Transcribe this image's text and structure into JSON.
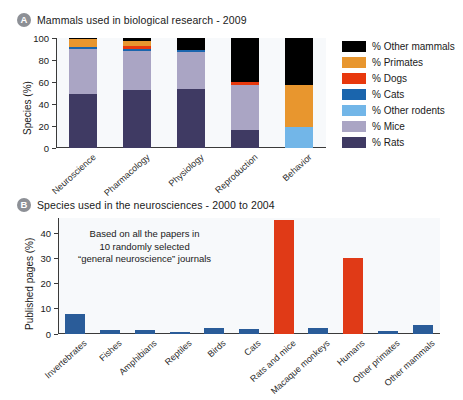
{
  "panel_a": {
    "badge": "A",
    "title": "Mammals used in biological research - 2009",
    "ylabel": "Species (%)",
    "categories": [
      "Neuroscience",
      "Pharmacology",
      "Physiology",
      "Reproduction",
      "Behavior"
    ],
    "yticks": [
      "0",
      "20",
      "40",
      "60",
      "80",
      "100"
    ]
  },
  "panel_b": {
    "badge": "B",
    "title": "Species used in the neurosciences - 2000 to 2004",
    "ylabel": "Published pages (%)",
    "yticks": [
      "0",
      "10",
      "20",
      "30",
      "40"
    ],
    "annotation_lines": [
      "Based on all the papers in",
      "10 randomly selected",
      "“general neuroscience” journals"
    ]
  },
  "legend": {
    "items": [
      {
        "label": "% Other mammals",
        "color": "#000000"
      },
      {
        "label": "% Primates",
        "color": "#e8962e"
      },
      {
        "label": "% Dogs",
        "color": "#e8380d"
      },
      {
        "label": "% Cats",
        "color": "#1a65ad"
      },
      {
        "label": "% Other rodents",
        "color": "#72b6e8"
      },
      {
        "label": "% Mice",
        "color": "#aaa5c4"
      },
      {
        "label": "% Rats",
        "color": "#3f3a63"
      }
    ]
  },
  "chart_data": [
    {
      "id": "panel-a",
      "type": "bar",
      "stacked": true,
      "title": "Mammals used in biological research - 2009",
      "xlabel": "",
      "ylabel": "Species (%)",
      "ylim": [
        0,
        100
      ],
      "yticks": [
        0,
        20,
        40,
        60,
        80,
        100
      ],
      "grid": false,
      "legend_position": "right",
      "categories": [
        "Neuroscience",
        "Pharmacology",
        "Physiology",
        "Reproduction",
        "Behavior"
      ],
      "series": [
        {
          "name": "% Rats",
          "color": "#3f3a63",
          "values": [
            49,
            53,
            54,
            16,
            0
          ]
        },
        {
          "name": "% Mice",
          "color": "#aaa5c4",
          "values": [
            41,
            35,
            33,
            41,
            0
          ]
        },
        {
          "name": "% Other rodents",
          "color": "#72b6e8",
          "values": [
            0,
            0,
            0,
            0,
            19
          ]
        },
        {
          "name": "% Cats",
          "color": "#1a65ad",
          "values": [
            2,
            2,
            2,
            0,
            0
          ]
        },
        {
          "name": "% Dogs",
          "color": "#e8380d",
          "values": [
            0,
            3,
            0,
            3,
            0
          ]
        },
        {
          "name": "% Primates",
          "color": "#e8962e",
          "values": [
            7,
            4,
            0,
            0,
            38
          ]
        },
        {
          "name": "% Other mammals",
          "color": "#000000",
          "values": [
            1,
            3,
            11,
            40,
            43
          ]
        }
      ]
    },
    {
      "id": "panel-b",
      "type": "bar",
      "stacked": false,
      "title": "Species used in the neurosciences - 2000 to 2004",
      "xlabel": "",
      "ylabel": "Published pages (%)",
      "ylim": [
        0,
        46
      ],
      "yticks": [
        0,
        10,
        20,
        30,
        40
      ],
      "grid": false,
      "annotation": "Based on all the papers in 10 randomly selected “general neuroscience” journals",
      "categories": [
        "Invertebrates",
        "Fishes",
        "Amphibians",
        "Reptiles",
        "Birds",
        "Cats",
        "Rats and mice",
        "Macaque monkeys",
        "Humans",
        "Other primates",
        "Other mammals"
      ],
      "values": [
        8.0,
        1.6,
        1.6,
        0.8,
        2.2,
        2.1,
        45.3,
        2.2,
        30.2,
        1.2,
        3.6
      ],
      "bar_colors": [
        "#2a5c99",
        "#2a5c99",
        "#2a5c99",
        "#2a5c99",
        "#2a5c99",
        "#2a5c99",
        "#e03a17",
        "#2a5c99",
        "#e03a17",
        "#2a5c99",
        "#2a5c99"
      ]
    }
  ]
}
